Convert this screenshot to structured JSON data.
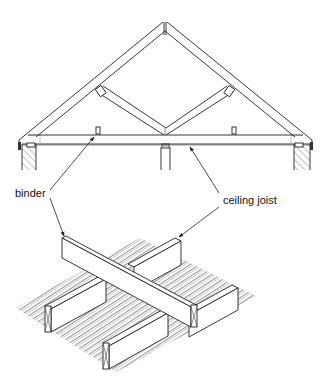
{
  "diagram": {
    "labels": {
      "binder": "binder",
      "ceiling_joist": "ceiling joist"
    },
    "views": [
      {
        "name": "truss-elevation",
        "description": "Gable roof truss elevation on two hatched walls with central support post"
      },
      {
        "name": "isometric-detail",
        "description": "Isometric view of binder crossing over ceiling joists on ceiling boards"
      }
    ],
    "colors": {
      "line": "#222222",
      "background": "#ffffff"
    }
  }
}
